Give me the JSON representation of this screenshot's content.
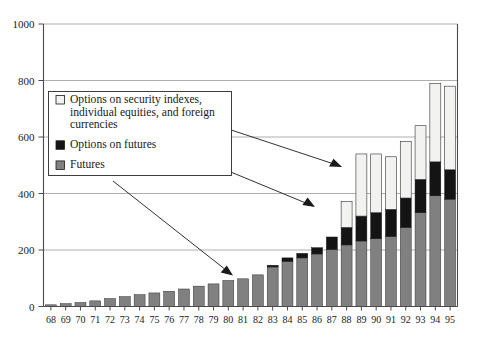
{
  "chart_data": {
    "type": "bar",
    "stacked": true,
    "title": "",
    "subtitle": "",
    "xlabel": "",
    "ylabel": "",
    "ylim": [
      0,
      1000
    ],
    "ytick_values": [
      0,
      200,
      400,
      600,
      800,
      1000
    ],
    "ytick_labels": [
      "0",
      "200",
      "400",
      "600",
      "800",
      "1000"
    ],
    "grid": "horizontal",
    "legend_position": "upper-left-inset",
    "categories": [
      "68",
      "69",
      "70",
      "71",
      "72",
      "73",
      "74",
      "75",
      "76",
      "77",
      "78",
      "79",
      "80",
      "81",
      "82",
      "83",
      "84",
      "85",
      "86",
      "87",
      "88",
      "89",
      "90",
      "91",
      "92",
      "93",
      "94",
      "95"
    ],
    "series": [
      {
        "name": "Futures",
        "color": "#808080",
        "values": [
          6,
          10,
          14,
          20,
          28,
          35,
          42,
          48,
          54,
          62,
          72,
          80,
          92,
          98,
          112,
          140,
          160,
          172,
          186,
          202,
          218,
          232,
          240,
          248,
          280,
          332,
          392,
          380
        ]
      },
      {
        "name": "Options on futures",
        "color": "#141414",
        "values": [
          0,
          0,
          0,
          0,
          0,
          0,
          0,
          0,
          0,
          0,
          0,
          0,
          0,
          0,
          0,
          6,
          12,
          16,
          22,
          44,
          62,
          88,
          92,
          96,
          104,
          118,
          120,
          104
        ]
      },
      {
        "name": "Options on security indexes, individual equities, and foreign currencies",
        "color": "#f2f2f0",
        "values": [
          0,
          0,
          0,
          0,
          0,
          0,
          0,
          0,
          0,
          0,
          0,
          0,
          0,
          0,
          0,
          0,
          0,
          0,
          0,
          0,
          92,
          220,
          208,
          186,
          200,
          190,
          278,
          296
        ]
      }
    ],
    "totals": [
      6,
      10,
      14,
      20,
      28,
      35,
      42,
      48,
      54,
      62,
      72,
      80,
      92,
      98,
      112,
      146,
      172,
      188,
      208,
      246,
      372,
      540,
      540,
      530,
      584,
      640,
      790,
      780
    ]
  },
  "legend": {
    "items": [
      {
        "swatch": "light-square-swatch",
        "label_lines": [
          "Options on security indexes,",
          "individual equities, and foreign",
          "currencies"
        ]
      },
      {
        "swatch": "black-square-swatch",
        "label_lines": [
          "Options on futures"
        ]
      },
      {
        "swatch": "gray-square-swatch",
        "label_lines": [
          "Futures"
        ]
      }
    ]
  },
  "annotations": {
    "arrows": [
      {
        "name": "arrow-to-options-on-securities",
        "target_category": "89"
      },
      {
        "name": "arrow-to-options-on-futures",
        "target_category": "87"
      },
      {
        "name": "arrow-to-futures",
        "target_category": "81"
      }
    ]
  },
  "colors": {
    "futures": "#808080",
    "options_on_futures": "#141414",
    "options_on_securities": "#f2f2f0",
    "axis": "#4a4a4a",
    "grid": "#9a9a9a",
    "text": "#1a1a1a"
  }
}
